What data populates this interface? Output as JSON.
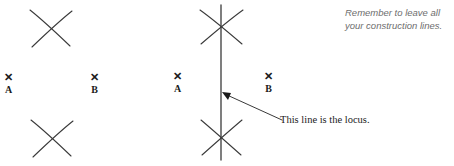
{
  "figure": {
    "type": "geometric-construction",
    "stroke_color": "#3a3a3a",
    "text_color": "#1b1b1b",
    "note_color": "#6e6e6e",
    "background_color": "#ffffff"
  },
  "left_diagram": {
    "name": "construction-arcs-stage",
    "points": [
      {
        "id": "A",
        "mark_glyph": "✕",
        "label": "A",
        "x": 8,
        "y": 72
      },
      {
        "id": "B",
        "mark_glyph": "✕",
        "label": "B",
        "x": 94,
        "y": 72
      }
    ],
    "arc_intersections": [
      {
        "name": "upper-arc-crossing",
        "cx": 51,
        "cy": 28
      },
      {
        "name": "lower-arc-crossing",
        "cx": 51,
        "cy": 138
      }
    ]
  },
  "right_diagram": {
    "name": "locus-line-stage",
    "points": [
      {
        "id": "A",
        "mark_glyph": "✕",
        "label": "A",
        "x": 172,
        "y": 71
      },
      {
        "id": "B",
        "mark_glyph": "✕",
        "label": "B",
        "x": 263,
        "y": 71
      }
    ],
    "locus_line": {
      "name": "perpendicular-bisector",
      "x": 221,
      "y_top": 5,
      "y_bottom": 160
    },
    "arc_intersections": [
      {
        "name": "upper-arc-crossing",
        "cx": 221,
        "cy": 27
      },
      {
        "name": "lower-arc-crossing",
        "cx": 221,
        "cy": 139
      }
    ],
    "annotation": {
      "caption": "This line is the locus.",
      "caption_x": 280,
      "caption_y": 114,
      "arrow_from_x": 282,
      "arrow_from_y": 120,
      "arrow_to_x": 224,
      "arrow_to_y": 93
    }
  },
  "note": {
    "name": "construction-lines-reminder",
    "line1": "Remember to leave all",
    "line2": "your construction lines.",
    "x": 345,
    "y": 6
  }
}
